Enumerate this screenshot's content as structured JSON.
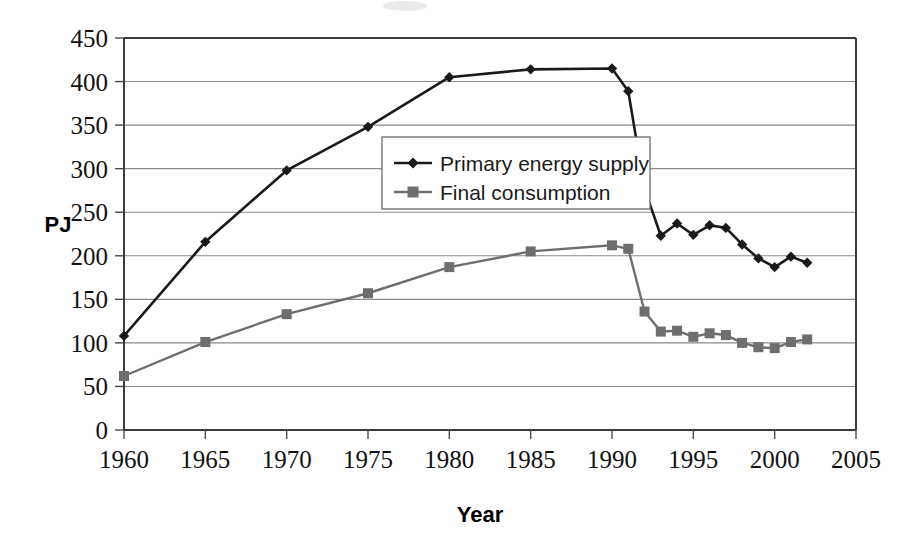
{
  "chart_data": {
    "type": "line",
    "title": "",
    "xlabel": "Year",
    "ylabel": "PJ",
    "xlim": [
      1960,
      2005
    ],
    "ylim": [
      0,
      450
    ],
    "ytick_step": 50,
    "xtick_step": 5,
    "grid": "horizontal",
    "legend_position": "inside-upper-center",
    "xticks": [
      "1960",
      "1965",
      "1970",
      "1975",
      "1980",
      "1985",
      "1990",
      "1995",
      "2000",
      "2005"
    ],
    "yticks": [
      "0",
      "50",
      "100",
      "150",
      "200",
      "250",
      "300",
      "350",
      "400",
      "450"
    ],
    "series": [
      {
        "name": "Primary energy supply",
        "marker": "diamond",
        "color": "#1a1a1a",
        "x": [
          1960,
          1965,
          1970,
          1975,
          1980,
          1985,
          1990,
          1991,
          1992,
          1993,
          1994,
          1995,
          1996,
          1997,
          1998,
          1999,
          2000,
          2001,
          2002
        ],
        "values": [
          108,
          216,
          298,
          348,
          405,
          414,
          415,
          389,
          277,
          223,
          237,
          224,
          235,
          232,
          213,
          197,
          187,
          199,
          192
        ]
      },
      {
        "name": "Final consumption",
        "marker": "square",
        "color": "#6e6e6e",
        "x": [
          1960,
          1965,
          1970,
          1975,
          1980,
          1985,
          1990,
          1991,
          1992,
          1993,
          1994,
          1995,
          1996,
          1997,
          1998,
          1999,
          2000,
          2001,
          2002
        ],
        "values": [
          62,
          101,
          133,
          157,
          187,
          205,
          212,
          208,
          136,
          113,
          114,
          107,
          111,
          109,
          100,
          95,
          94,
          101,
          104
        ]
      }
    ]
  },
  "legend": {
    "entries": [
      {
        "label": "Primary energy supply",
        "marker": "diamond-marker-icon"
      },
      {
        "label": "Final consumption",
        "marker": "square-marker-icon"
      }
    ]
  },
  "colors": {
    "primary_series": "#1a1a1a",
    "secondary_series": "#6e6e6e",
    "grid": "#8a8a8a",
    "frame": "#3b3b3b",
    "background": "#ffffff"
  }
}
